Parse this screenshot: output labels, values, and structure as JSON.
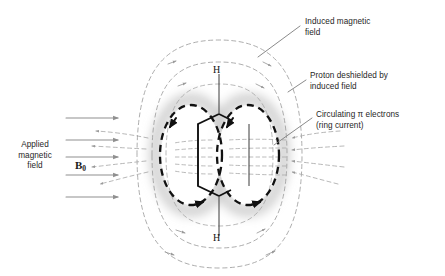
{
  "figure": {
    "background_color": "#ffffff"
  },
  "colors": {
    "field_line": "#9a9a9a",
    "ring_current": "#111111",
    "molecule_bond": "#111111",
    "applied_arrow": "#8c8c8c",
    "leader_line": "#7d7d7d",
    "text": "#262626",
    "halo": "#cfcfcf"
  },
  "annotations": {
    "induced_field": {
      "line1": "Induced magnetic",
      "line2": "field"
    },
    "deshielded_proton": {
      "line1": "Proton deshielded by",
      "line2": "induced field"
    },
    "ring_current": {
      "line1": "Circulating π electrons",
      "line2": "(ring current)"
    },
    "applied_field": {
      "line1": "Applied",
      "line2": "magnetic",
      "line3": "field"
    },
    "b0_symbol": "B",
    "b0_subscript": "0"
  },
  "molecule": {
    "proton_top": "H",
    "proton_bottom": "H"
  },
  "applied_field_arrows": {
    "count": 5,
    "direction": "right",
    "y_positions": [
      118,
      140,
      157,
      175,
      197
    ],
    "x_start": 66,
    "x_end": 122
  },
  "induced_field_loops": {
    "outer_pairs": 2,
    "arrow_direction_top": "right",
    "arrow_direction_side": "left",
    "note": "Dashed closed field loops above and below the ring, returning inward through the ring center"
  },
  "ring_current_ellipses": {
    "count": 2,
    "arrow_direction": "counterclockwise-front",
    "note": "Two bold dashed ellipses representing circulating pi electrons above and below the ring plane"
  }
}
